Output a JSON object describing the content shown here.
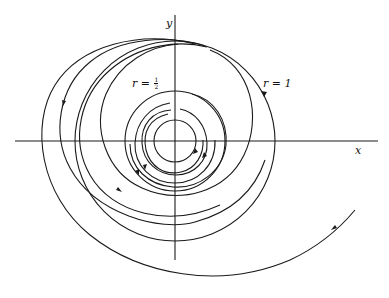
{
  "figure": {
    "type": "phase-portrait",
    "axes": {
      "x_label": "x",
      "y_label": "y"
    },
    "labels": {
      "inner_cycle": {
        "prefix": "r = ",
        "numerator": "1",
        "denominator": "2"
      },
      "outer_cycle": {
        "text": "r = 1"
      }
    },
    "colors": {
      "stroke": "#1a1a1a",
      "background": "#ffffff"
    },
    "geometry": {
      "center": [
        175,
        141
      ],
      "outer_cycle_radius": 100,
      "inner_cycle_radius": 50,
      "innermost_circle_radius": 21
    }
  }
}
